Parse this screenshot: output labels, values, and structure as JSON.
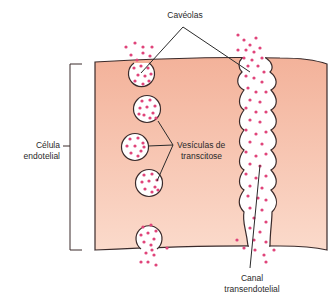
{
  "diagram": {
    "labels": {
      "caveolas": "Cavéolas",
      "celula_line1": "Célula",
      "celula_line2": "endotelial",
      "vesiculas_line1": "Vesículas de",
      "vesiculas_line2": "transcitose",
      "canal_line1": "Canal",
      "canal_line2": "transendotelial"
    },
    "colors": {
      "cell_fill_top": "#f4b39c",
      "cell_fill_bottom": "#fbd9ca",
      "outline": "#3a2a2a",
      "particle": "#e0447a",
      "vesicle_fill": "#ffffff",
      "text": "#2a2a2a"
    },
    "structures": [
      {
        "name": "caveola-top",
        "type": "open vesicle at luminal surface"
      },
      {
        "name": "vesicle-1",
        "type": "transcytosis vesicle"
      },
      {
        "name": "vesicle-2",
        "type": "transcytosis vesicle"
      },
      {
        "name": "vesicle-3",
        "type": "transcytosis vesicle"
      },
      {
        "name": "caveola-bottom",
        "type": "open vesicle at abluminal surface"
      },
      {
        "name": "transendothelial-channel",
        "type": "fused vesicle channel"
      }
    ]
  }
}
